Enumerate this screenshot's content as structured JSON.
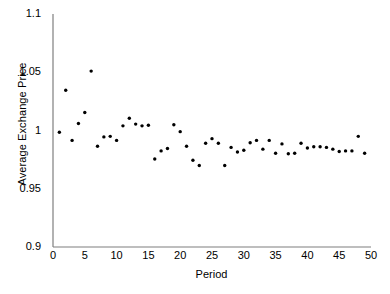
{
  "chart_data": {
    "type": "scatter",
    "title": "",
    "xlabel": "Period",
    "ylabel": "Average Exchange Price",
    "xlim": [
      0,
      50
    ],
    "ylim": [
      0.9,
      1.1
    ],
    "xticks": [
      0,
      5,
      10,
      15,
      20,
      25,
      30,
      35,
      40,
      45,
      50
    ],
    "xtick_labels": [
      "0",
      "5",
      "10",
      "15",
      "20",
      "25",
      "30",
      "35",
      "40",
      "45",
      "50"
    ],
    "yticks": [
      0.9,
      0.95,
      1.0,
      1.05,
      1.1
    ],
    "ytick_labels": [
      "0.9",
      "0.95",
      "1",
      "1.05",
      "1.1"
    ],
    "grid": false,
    "legend": null,
    "marker": {
      "shape": "circle",
      "color": "#000000",
      "size_px": 3.4
    },
    "axis_color": "#808080",
    "background": "#ffffff",
    "x": [
      1,
      2,
      3,
      4,
      5,
      6,
      7,
      8,
      9,
      10,
      11,
      12,
      13,
      14,
      15,
      16,
      17,
      18,
      19,
      20,
      21,
      22,
      23,
      24,
      25,
      26,
      27,
      28,
      29,
      30,
      31,
      32,
      33,
      34,
      35,
      36,
      37,
      38,
      39,
      40,
      41,
      42,
      43,
      44,
      45,
      46,
      47,
      48,
      49
    ],
    "y": [
      0.9985,
      1.0345,
      0.9915,
      1.006,
      1.0155,
      1.051,
      0.9865,
      0.9945,
      0.995,
      0.9915,
      1.004,
      1.0105,
      1.0055,
      1.004,
      1.0045,
      0.9755,
      0.9825,
      0.9845,
      1.005,
      0.999,
      0.9865,
      0.9745,
      0.97,
      0.989,
      0.993,
      0.989,
      0.97,
      0.9855,
      0.9815,
      0.983,
      0.9895,
      0.9915,
      0.984,
      0.9915,
      0.9805,
      0.9885,
      0.98,
      0.9805,
      0.989,
      0.985,
      0.986,
      0.986,
      0.9855,
      0.984,
      0.982,
      0.9825,
      0.9825,
      0.995,
      0.9805
    ],
    "n_points": 49,
    "series_name": "Average Exchange Price"
  }
}
